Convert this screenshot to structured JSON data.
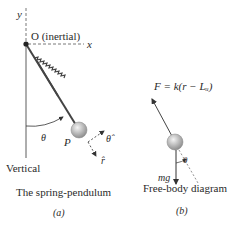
{
  "panel_a": {
    "axis_y": "y",
    "axis_x": "x",
    "origin_label": "O (inertial)",
    "angle": "θ",
    "point": "P",
    "unit_theta": "θ̂",
    "unit_r": "r̂",
    "vertical": "Vertical",
    "caption": "The spring-pendulum",
    "sublabel": "(a)"
  },
  "panel_b": {
    "force": "F = k(r − Lᵤ)",
    "weight": "mg",
    "angle": "θ",
    "caption": "Free-body diagram",
    "sublabel": "(b)"
  },
  "colors": {
    "line": "#333333",
    "dash": "#555555",
    "bob_light": "#f2f2f2",
    "bob_dark": "#9a9a9a",
    "text": "#2a2a2a"
  }
}
